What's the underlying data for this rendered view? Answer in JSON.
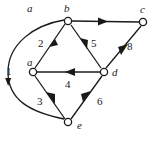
{
  "figure": {
    "type": "directed-graph",
    "background_color": "#ffffff",
    "stroke_color": "#1a1a1a",
    "node_fill": "#ffffff",
    "width": 159,
    "height": 144
  },
  "nodes": [
    {
      "id": "a",
      "label": "a",
      "cx": 33,
      "cy": 72,
      "label_x": 27,
      "label_y": 57
    },
    {
      "id": "b",
      "label": "b",
      "cx": 68,
      "cy": 21,
      "label_x": 64,
      "label_y": 3
    },
    {
      "id": "c",
      "label": "c",
      "cx": 143,
      "cy": 22,
      "label_x": 140,
      "label_y": 4
    },
    {
      "id": "d",
      "label": "d",
      "cx": 104,
      "cy": 72,
      "label_x": 112,
      "label_y": 68
    },
    {
      "id": "e",
      "label": "e",
      "cx": 68,
      "cy": 122,
      "label_x": 77,
      "label_y": 121
    }
  ],
  "edges": [
    {
      "id": "a-b",
      "from": "a",
      "to": "b",
      "label": "2",
      "label_x": 38,
      "label_y": 38,
      "shape": "straight"
    },
    {
      "id": "b-c",
      "from": "b",
      "to": "c",
      "label": "",
      "label_x": 0,
      "label_y": 0,
      "shape": "straight"
    },
    {
      "id": "b-d",
      "from": "b",
      "to": "d",
      "label": "5",
      "label_x": 91,
      "label_y": 38,
      "shape": "straight"
    },
    {
      "id": "d-a",
      "from": "d",
      "to": "a",
      "label": "4",
      "label_x": 65,
      "label_y": 79,
      "shape": "straight"
    },
    {
      "id": "d-c",
      "from": "d",
      "to": "c",
      "label": "8",
      "label_x": 127,
      "label_y": 41,
      "shape": "straight"
    },
    {
      "id": "a-e",
      "from": "a",
      "to": "e",
      "label": "3",
      "label_x": 37,
      "label_y": 96,
      "shape": "straight"
    },
    {
      "id": "e-d",
      "from": "e",
      "to": "d",
      "label": "6",
      "label_x": 97,
      "label_y": 96,
      "shape": "straight"
    },
    {
      "id": "e-b",
      "from": "e",
      "to": "b",
      "label": "1",
      "label_x": 6,
      "label_y": 66,
      "shape": "curved-arc-left"
    }
  ]
}
